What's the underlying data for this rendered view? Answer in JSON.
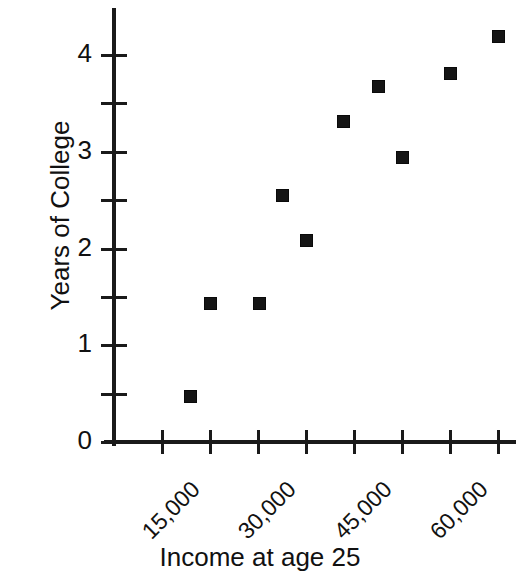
{
  "chart_data": {
    "type": "scatter",
    "title": "",
    "xlabel": "Income at age 25",
    "ylabel": "Years of College",
    "xlim": [
      7500,
      63750
    ],
    "ylim": [
      0,
      4.5
    ],
    "grid": false,
    "legend": null,
    "x_ticks": [
      7500,
      15000,
      22500,
      30000,
      37500,
      45000,
      52500,
      60000
    ],
    "x_tick_labels": [
      "",
      "15,000",
      "",
      "30,000",
      "",
      "45,000",
      "",
      "60,000"
    ],
    "x_tick_labels_visible": [
      "15,000",
      "30,000",
      "45,000",
      "60,000"
    ],
    "y_ticks": [
      0,
      0.5,
      1,
      1.5,
      2,
      2.5,
      3,
      3.5,
      4
    ],
    "y_tick_labels": [
      "0",
      "",
      "1",
      "",
      "2",
      "",
      "3",
      "",
      "4"
    ],
    "y_tick_labels_visible": [
      "0",
      "1",
      "2",
      "3",
      "4"
    ],
    "marker": "square",
    "marker_color": "#151515",
    "points": [
      {
        "x": 11900,
        "y": 0.47
      },
      {
        "x": 15000,
        "y": 1.43
      },
      {
        "x": 22700,
        "y": 1.43
      },
      {
        "x": 26250,
        "y": 2.55
      },
      {
        "x": 30000,
        "y": 2.08
      },
      {
        "x": 35800,
        "y": 3.31
      },
      {
        "x": 41250,
        "y": 3.67
      },
      {
        "x": 45150,
        "y": 2.94
      },
      {
        "x": 52500,
        "y": 3.81
      },
      {
        "x": 60000,
        "y": 4.19
      }
    ],
    "x": [
      11900,
      15000,
      22700,
      26250,
      30000,
      35800,
      41250,
      45150,
      52500,
      60000
    ],
    "y": [
      0.47,
      1.43,
      1.43,
      2.55,
      2.08,
      3.31,
      3.67,
      2.94,
      3.81,
      4.19
    ]
  },
  "axes": {
    "y_title": "Years of College",
    "x_title": "Income at age 25"
  },
  "colors": {
    "axis": "#1a1a1a",
    "marker": "#151515",
    "text": "#111111",
    "background": "#ffffff"
  }
}
